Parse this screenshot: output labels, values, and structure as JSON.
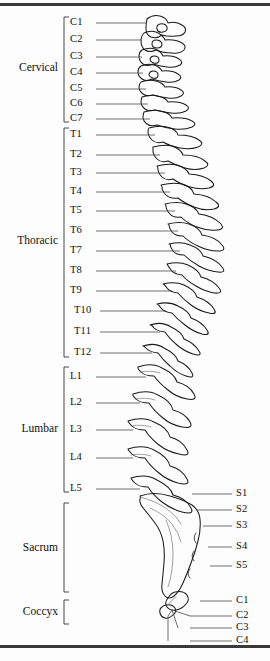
{
  "figure": {
    "background_color": "#fdfdfd",
    "line_color": "#1a1a1a",
    "leader_color": "#555555",
    "border_color": "#3a3a3a"
  },
  "regions": [
    {
      "name": "Cervical",
      "label": "Cervical",
      "bracket_top": 17,
      "bracket_bottom": 122,
      "label_y": 68,
      "label_right": 58
    },
    {
      "name": "Thoracic",
      "label": "Thoracic",
      "bracket_top": 128,
      "bracket_bottom": 357,
      "label_y": 241,
      "label_right": 58
    },
    {
      "name": "Lumbar",
      "label": "Lumbar",
      "bracket_top": 367,
      "bracket_bottom": 492,
      "label_y": 429,
      "label_right": 58
    },
    {
      "name": "Sacrum",
      "label": "Sacrum",
      "bracket_top": 503,
      "bracket_bottom": 592,
      "label_y": 548,
      "label_right": 58
    },
    {
      "name": "Coccyx",
      "label": "Coccyx",
      "bracket_top": 600,
      "bracket_bottom": 624,
      "label_y": 612,
      "label_right": 58
    }
  ],
  "levels_left": [
    {
      "id": "C1",
      "label": "C1",
      "y": 23,
      "leader_x1": 96,
      "leader_x2": 146
    },
    {
      "id": "C2",
      "label": "C2",
      "y": 40,
      "leader_x1": 96,
      "leader_x2": 142
    },
    {
      "id": "C3",
      "label": "C3",
      "y": 57,
      "leader_x1": 96,
      "leader_x2": 142
    },
    {
      "id": "C4",
      "label": "C4",
      "y": 73,
      "leader_x1": 96,
      "leader_x2": 143
    },
    {
      "id": "C5",
      "label": "C5",
      "y": 89,
      "leader_x1": 96,
      "leader_x2": 146
    },
    {
      "id": "C6",
      "label": "C6",
      "y": 104,
      "leader_x1": 96,
      "leader_x2": 148
    },
    {
      "id": "C7",
      "label": "C7",
      "y": 119,
      "leader_x1": 96,
      "leader_x2": 150
    },
    {
      "id": "T1",
      "label": "T1",
      "y": 135,
      "leader_x1": 96,
      "leader_x2": 155
    },
    {
      "id": "T2",
      "label": "T2",
      "y": 155,
      "leader_x1": 96,
      "leader_x2": 160
    },
    {
      "id": "T3",
      "label": "T3",
      "y": 173,
      "leader_x1": 96,
      "leader_x2": 165
    },
    {
      "id": "T4",
      "label": "T4",
      "y": 192,
      "leader_x1": 96,
      "leader_x2": 170
    },
    {
      "id": "T5",
      "label": "T5",
      "y": 211,
      "leader_x1": 96,
      "leader_x2": 175
    },
    {
      "id": "T6",
      "label": "T6",
      "y": 231,
      "leader_x1": 96,
      "leader_x2": 178
    },
    {
      "id": "T7",
      "label": "T7",
      "y": 251,
      "leader_x1": 96,
      "leader_x2": 180
    },
    {
      "id": "T8",
      "label": "T8",
      "y": 271,
      "leader_x1": 96,
      "leader_x2": 176
    },
    {
      "id": "T9",
      "label": "T9",
      "y": 291,
      "leader_x1": 96,
      "leader_x2": 172
    },
    {
      "id": "T10",
      "label": "T10",
      "y": 311,
      "leader_x1": 100,
      "leader_x2": 166
    },
    {
      "id": "T11",
      "label": "T11",
      "y": 332,
      "leader_x1": 100,
      "leader_x2": 160
    },
    {
      "id": "T12",
      "label": "T12",
      "y": 353,
      "leader_x1": 100,
      "leader_x2": 152
    },
    {
      "id": "L1",
      "label": "L1",
      "y": 377,
      "leader_x1": 96,
      "leader_x2": 146
    },
    {
      "id": "L2",
      "label": "L2",
      "y": 403,
      "leader_x1": 96,
      "leader_x2": 140
    },
    {
      "id": "L3",
      "label": "L3",
      "y": 430,
      "leader_x1": 96,
      "leader_x2": 133
    },
    {
      "id": "L4",
      "label": "L4",
      "y": 458,
      "leader_x1": 96,
      "leader_x2": 133
    },
    {
      "id": "L5",
      "label": "L5",
      "y": 489,
      "leader_x1": 96,
      "leader_x2": 140
    }
  ],
  "levels_right": [
    {
      "id": "S1",
      "label": "S1",
      "y": 494,
      "leader_x1": 192,
      "leader_x2": 232
    },
    {
      "id": "S2",
      "label": "S2",
      "y": 510,
      "leader_x1": 196,
      "leader_x2": 232
    },
    {
      "id": "S3",
      "label": "S3",
      "y": 526,
      "leader_x1": 203,
      "leader_x2": 232
    },
    {
      "id": "S4",
      "label": "S4",
      "y": 547,
      "leader_x1": 208,
      "leader_x2": 232
    },
    {
      "id": "S5",
      "label": "S5",
      "y": 566,
      "leader_x1": 210,
      "leader_x2": 232
    },
    {
      "id": "C1",
      "label": "C1",
      "y": 601,
      "leader_x1": 200,
      "leader_x2": 232
    },
    {
      "id": "C2",
      "label": "C2",
      "y": 616,
      "leader_x1": 190,
      "leader_x2": 232
    },
    {
      "id": "C3",
      "label": "C3",
      "y": 628,
      "leader_x1": 178,
      "leader_x2": 232
    },
    {
      "id": "C4",
      "label": "C4",
      "y": 641,
      "leader_x1": 168,
      "leader_x2": 232
    }
  ]
}
